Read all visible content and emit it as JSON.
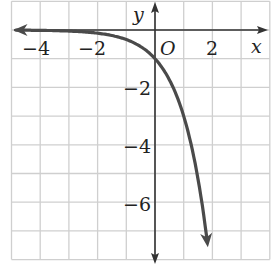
{
  "chart_data": {
    "type": "line",
    "title": "",
    "xlabel": "x",
    "ylabel": "y",
    "origin_label": "O",
    "xlim": [
      -5,
      4
    ],
    "ylim": [
      -8,
      1
    ],
    "grid": true,
    "x_tick_labels": [
      "−4",
      "−2",
      "2"
    ],
    "x_ticks": [
      -4,
      -2,
      2
    ],
    "y_tick_labels": [
      "−2",
      "−4",
      "−6"
    ],
    "y_ticks": [
      -2,
      -4,
      -6
    ],
    "series": [
      {
        "name": "y = −3^x",
        "function": "-3^x",
        "x": [
          -5,
          -4,
          -3,
          -2,
          -1,
          0,
          0.5,
          1,
          1.5,
          1.85
        ],
        "y": [
          -0.004,
          -0.012,
          -0.037,
          -0.111,
          -0.333,
          -1,
          -1.73,
          -3,
          -5.2,
          -7.6
        ],
        "arrows": "both ends"
      }
    ],
    "colors": {
      "curve": "#444444",
      "grid": "#c8c8c8",
      "axes": "#333333"
    }
  }
}
